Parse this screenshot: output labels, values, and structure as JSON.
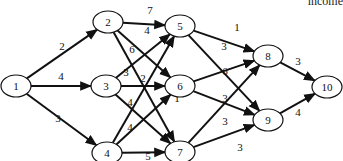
{
  "caption": "income",
  "nodes": [
    {
      "id": "1",
      "x": 16,
      "y": 86
    },
    {
      "id": "2",
      "x": 108,
      "y": 22
    },
    {
      "id": "3",
      "x": 106,
      "y": 86
    },
    {
      "id": "4",
      "x": 107,
      "y": 153
    },
    {
      "id": "5",
      "x": 180,
      "y": 26
    },
    {
      "id": "6",
      "x": 180,
      "y": 86
    },
    {
      "id": "7",
      "x": 180,
      "y": 152
    },
    {
      "id": "8",
      "x": 268,
      "y": 56
    },
    {
      "id": "9",
      "x": 268,
      "y": 120
    },
    {
      "id": "10",
      "x": 327,
      "y": 87
    }
  ],
  "edges": [
    {
      "from": "1",
      "to": "2",
      "weight": "2",
      "lx": 62,
      "ly": 50
    },
    {
      "from": "1",
      "to": "3",
      "weight": "4",
      "lx": 61,
      "ly": 80
    },
    {
      "from": "1",
      "to": "4",
      "weight": "3",
      "lx": 58,
      "ly": 122
    },
    {
      "from": "2",
      "to": "5",
      "weight": "7",
      "lx": 150,
      "ly": 14
    },
    {
      "from": "2",
      "to": "6",
      "weight": "4",
      "lx": 147,
      "ly": 34
    },
    {
      "from": "2",
      "to": "7",
      "weight": "6",
      "lx": 132,
      "ly": 53
    },
    {
      "from": "3",
      "to": "5",
      "weight": "3",
      "lx": 126,
      "ly": 76
    },
    {
      "from": "3",
      "to": "6",
      "weight": "2",
      "lx": 143,
      "ly": 82
    },
    {
      "from": "3",
      "to": "7",
      "weight": "4",
      "lx": 130,
      "ly": 106
    },
    {
      "from": "4",
      "to": "5",
      "weight": "4",
      "lx": 130,
      "ly": 131
    },
    {
      "from": "4",
      "to": "6",
      "weight": "1",
      "lx": 177,
      "ly": 102
    },
    {
      "from": "4",
      "to": "7",
      "weight": "5",
      "lx": 148,
      "ly": 160
    },
    {
      "from": "5",
      "to": "8",
      "weight": "1",
      "lx": 237,
      "ly": 31
    },
    {
      "from": "5",
      "to": "9",
      "weight": "3",
      "lx": 224,
      "ly": 50
    },
    {
      "from": "6",
      "to": "8",
      "weight": "6",
      "lx": 225,
      "ly": 75
    },
    {
      "from": "6",
      "to": "9",
      "weight": "3",
      "lx": 225,
      "ly": 102
    },
    {
      "from": "7",
      "to": "8",
      "weight": "3",
      "lx": 225,
      "ly": 125
    },
    {
      "from": "7",
      "to": "9",
      "weight": "3",
      "lx": 240,
      "ly": 151
    },
    {
      "from": "8",
      "to": "10",
      "weight": "3",
      "lx": 298,
      "ly": 65
    },
    {
      "from": "9",
      "to": "10",
      "weight": "4",
      "lx": 298,
      "ly": 116
    }
  ],
  "style": {
    "stroke": "#111111",
    "node_fill": "#ffffff"
  }
}
